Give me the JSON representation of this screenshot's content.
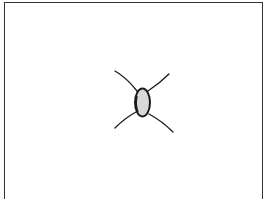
{
  "figure": {
    "colors": {
      "stroke": "#1a1a1a",
      "fill": "#d9d9d9",
      "frame": "#333333",
      "background": "#ffffff"
    }
  }
}
